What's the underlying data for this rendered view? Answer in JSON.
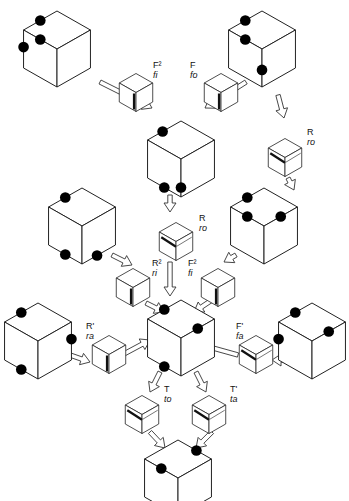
{
  "figure": {
    "caption_partial": "Figure (caption cut off at bottom edge)",
    "cubes": [
      {
        "id": "top-left",
        "cx": 57,
        "cy": 38,
        "dots": [
          "top-left-edge-upper",
          "top-face-center-left",
          "left-edge-mid"
        ]
      },
      {
        "id": "top-right",
        "cx": 262,
        "cy": 38,
        "dots": [
          "top-left-edge-upper",
          "top-face-center-left",
          "front-edge-mid"
        ]
      },
      {
        "id": "center-1",
        "cx": 181,
        "cy": 148,
        "dots": [
          "top-left-corner",
          "front-edge-lower",
          "bottom-left-edge"
        ]
      },
      {
        "id": "mid-left",
        "cx": 82,
        "cy": 215,
        "dots": [
          "top-left-edge",
          "bottom-left-edge",
          "bottom-right-edge"
        ]
      },
      {
        "id": "mid-right",
        "cx": 264,
        "cy": 215,
        "dots": [
          "top-left-edge",
          "top-face-center-left",
          "top-right-edge"
        ]
      },
      {
        "id": "center-2",
        "cx": 181,
        "cy": 327,
        "dots": [
          "top-left-edge",
          "right-edge-upper",
          "bottom-left-edge"
        ]
      },
      {
        "id": "bottom-left",
        "cx": 38,
        "cy": 330,
        "dots": [
          "top-left-edge",
          "right-face-mid",
          "bottom-left-edge"
        ]
      },
      {
        "id": "bottom-right",
        "cx": 312,
        "cy": 330,
        "dots": [
          "top-left-edge",
          "top-right-edge",
          "left-edge-mid"
        ]
      },
      {
        "id": "bottom-center",
        "cx": 178,
        "cy": 467,
        "dots": [
          "top-right-corner",
          "left-edge-upper",
          "bottom-left-edge"
        ]
      }
    ],
    "moves": [
      {
        "id": "F2-fi",
        "move": "F²",
        "sub": "fi",
        "label_x": 153,
        "label_y": 60
      },
      {
        "id": "F-fo",
        "move": "F",
        "sub": "fo",
        "label_x": 190,
        "label_y": 60
      },
      {
        "id": "R-ro-right",
        "move": "R",
        "sub": "ro",
        "label_x": 307,
        "label_y": 127
      },
      {
        "id": "R-ro-center",
        "move": "R",
        "sub": "ro",
        "label_x": 199,
        "label_y": 213
      },
      {
        "id": "R2-ri",
        "move": "R²",
        "sub": "ri",
        "label_x": 152,
        "label_y": 258
      },
      {
        "id": "F2-fi-2",
        "move": "F²",
        "sub": "fi",
        "label_x": 188,
        "label_y": 258
      },
      {
        "id": "Rp-ra",
        "move": "R'",
        "sub": "ra",
        "label_x": 86,
        "label_y": 321
      },
      {
        "id": "Fp-fa",
        "move": "F'",
        "sub": "fa",
        "label_x": 236,
        "label_y": 321
      },
      {
        "id": "T-to",
        "move": "T",
        "sub": "to",
        "label_x": 164,
        "label_y": 384
      },
      {
        "id": "Tp-ta",
        "move": "T'",
        "sub": "ta",
        "label_x": 230,
        "label_y": 384
      }
    ],
    "colors": {
      "line": "#222222",
      "dot": "#000000",
      "background": "#ffffff",
      "stripe": "#111111"
    }
  }
}
